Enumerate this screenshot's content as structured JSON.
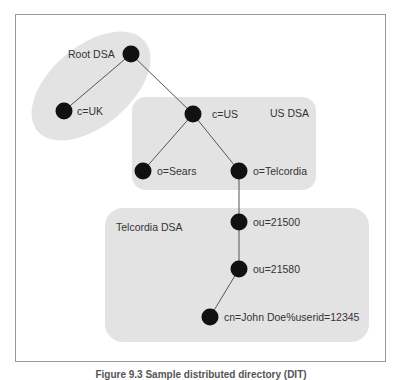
{
  "diagram": {
    "regions": {
      "root_dsa": {
        "label": "Root DSA"
      },
      "us_dsa": {
        "label": "US DSA"
      },
      "telcordia_dsa": {
        "label": "Telcordia DSA"
      }
    },
    "nodes": {
      "root": {
        "label": ""
      },
      "c_uk": {
        "label": "c=UK"
      },
      "c_us": {
        "label": "c=US"
      },
      "o_sears": {
        "label": "o=Sears"
      },
      "o_telcordia": {
        "label": "o=Telcordia"
      },
      "ou_21500": {
        "label": "ou=21500"
      },
      "ou_21580": {
        "label": "ou=21580"
      },
      "cn_john": {
        "label": "cn=John Doe%userid=12345"
      }
    },
    "edges": [
      [
        "root",
        "c_uk"
      ],
      [
        "root",
        "c_us"
      ],
      [
        "c_us",
        "o_sears"
      ],
      [
        "c_us",
        "o_telcordia"
      ],
      [
        "o_telcordia",
        "ou_21500"
      ],
      [
        "ou_21500",
        "ou_21580"
      ],
      [
        "ou_21580",
        "cn_john"
      ]
    ],
    "colors": {
      "region_fill": "#e3e3e3",
      "node_fill": "#111111",
      "edge": "#555555",
      "frame": "#9a9a9a"
    }
  },
  "caption": "Figure 9.3  Sample distributed directory (DIT)"
}
